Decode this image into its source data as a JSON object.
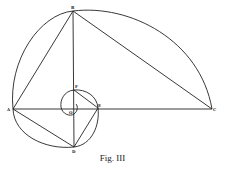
{
  "figure": {
    "caption": "Fig. III",
    "stroke_color": "#222222",
    "points": {
      "A": {
        "label": "A",
        "x": 13,
        "y": 109
      },
      "B": {
        "label": "B",
        "x": 73,
        "y": 11
      },
      "C": {
        "label": "C",
        "x": 212,
        "y": 109
      },
      "D": {
        "label": "D",
        "x": 74,
        "y": 147
      },
      "E": {
        "label": "E",
        "x": 98,
        "y": 108
      },
      "F": {
        "label": "F",
        "x": 74,
        "y": 90
      },
      "O": {
        "label": "O",
        "x": 72,
        "y": 110
      }
    },
    "segments": [
      "AB",
      "BC",
      "AC",
      "BD",
      "AD",
      "DE",
      "EF"
    ],
    "arcs": [
      "A-B-C (large)",
      "A-D-E (lower)",
      "E-F-O (spiral)"
    ]
  }
}
